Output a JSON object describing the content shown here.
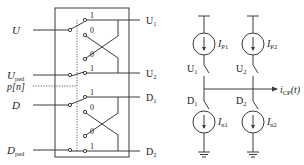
{
  "left_block": {
    "inputs": [
      {
        "label": "U",
        "sub": ""
      },
      {
        "label": "U",
        "sub": "ped"
      },
      {
        "label": "p[n]",
        "sub": ""
      },
      {
        "label": "D",
        "sub": ""
      },
      {
        "label": "D",
        "sub": "ped"
      }
    ],
    "outputs": [
      {
        "label": "U",
        "sub": "1"
      },
      {
        "label": "U",
        "sub": "2"
      },
      {
        "label": "D",
        "sub": "1"
      },
      {
        "label": "D",
        "sub": "2"
      }
    ],
    "switch_positions": {
      "one": "1",
      "zero": "0"
    }
  },
  "right_circuit": {
    "sources": [
      {
        "label": "I",
        "sub": "P1"
      },
      {
        "label": "I",
        "sub": "P2"
      },
      {
        "label": "I",
        "sub": "n1"
      },
      {
        "label": "I",
        "sub": "n2"
      }
    ],
    "switches": [
      {
        "label": "U",
        "sub": "1"
      },
      {
        "label": "U",
        "sub": "2"
      },
      {
        "label": "D",
        "sub": "1"
      },
      {
        "label": "D",
        "sub": "2"
      }
    ],
    "output": {
      "label": "i",
      "sub": "CP",
      "suffix": "(t)"
    }
  }
}
